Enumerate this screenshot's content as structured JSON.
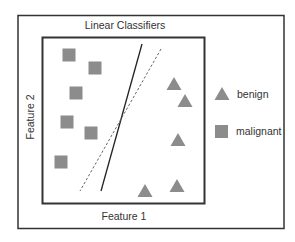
{
  "diagram": {
    "title": "Linear Classifiers",
    "x_axis_label": "Feature 1",
    "y_axis_label": "Feature 2",
    "legend": [
      {
        "label": "benign",
        "marker": "triangle-icon"
      },
      {
        "label": "malignant",
        "marker": "square-icon"
      }
    ],
    "colors": {
      "marker_fill": "#8c8c8c",
      "frame": "#333333",
      "solid_line": "#222222",
      "dashed_line": "#666666"
    },
    "malignant_points": [
      {
        "x": 69,
        "y": 55
      },
      {
        "x": 95,
        "y": 68
      },
      {
        "x": 76,
        "y": 93
      },
      {
        "x": 67,
        "y": 122
      },
      {
        "x": 91,
        "y": 133
      },
      {
        "x": 61,
        "y": 162
      }
    ],
    "benign_points": [
      {
        "x": 174,
        "y": 84
      },
      {
        "x": 185,
        "y": 101
      },
      {
        "x": 178,
        "y": 140
      },
      {
        "x": 145,
        "y": 191
      },
      {
        "x": 177,
        "y": 186
      }
    ],
    "classifiers": [
      {
        "style": "solid",
        "x1": 142,
        "y1": 44,
        "x2": 101,
        "y2": 191
      },
      {
        "style": "dashed",
        "x1": 161,
        "y1": 49,
        "x2": 80,
        "y2": 191
      }
    ]
  }
}
